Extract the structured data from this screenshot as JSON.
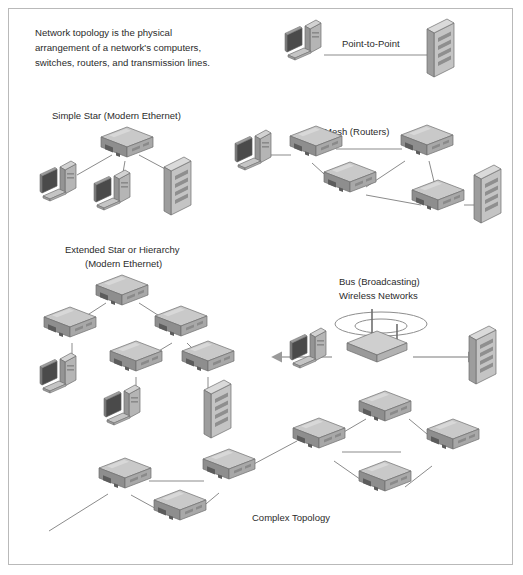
{
  "figure": {
    "background_color": "#ffffff",
    "border_color": "#b9b9b9",
    "line_color": "#8b8b8b",
    "text_color": "#2b2b2b"
  },
  "intro": {
    "line1": "Network topology is the physical",
    "line2": "arrangement of a network's computers,",
    "line3": "switches, routers, and transmission lines."
  },
  "sections": {
    "point_to_point": {
      "label": "Point-to-Point",
      "nodes": [
        "computer",
        "server"
      ],
      "links": 1
    },
    "simple_star": {
      "label": "Simple Star (Modern Ethernet)",
      "nodes": [
        "switch",
        "computer",
        "computer",
        "server"
      ],
      "links": 3
    },
    "mesh": {
      "label": "Mesh (Routers)",
      "nodes": [
        "computer",
        "router",
        "router",
        "router",
        "router",
        "server"
      ],
      "links": 8
    },
    "extended_star": {
      "label_line1": "Extended Star or Hierarchy",
      "label_line2": "(Modern Ethernet)",
      "nodes": [
        "switch",
        "switch",
        "switch",
        "switch",
        "switch",
        "computer",
        "computer",
        "server"
      ],
      "links": 7
    },
    "bus_wireless": {
      "label_line1": "Bus (Broadcasting)",
      "label_line2": "Wireless Networks",
      "nodes": [
        "computer",
        "access-point",
        "server"
      ],
      "links": 2
    },
    "complex": {
      "label": "Complex Topology",
      "nodes": [
        "router",
        "router",
        "router",
        "router",
        "router",
        "router",
        "router"
      ],
      "links": 9
    }
  },
  "colors": {
    "device_top": "#c9c9c9",
    "device_front": "#8e8e8e",
    "device_side": "#a8a8a8",
    "monitor_screen": "#4a4a4a",
    "tower_body": "#bdbdbd",
    "server_body": "#c4c4c4",
    "edge": "#6f6f6f"
  }
}
